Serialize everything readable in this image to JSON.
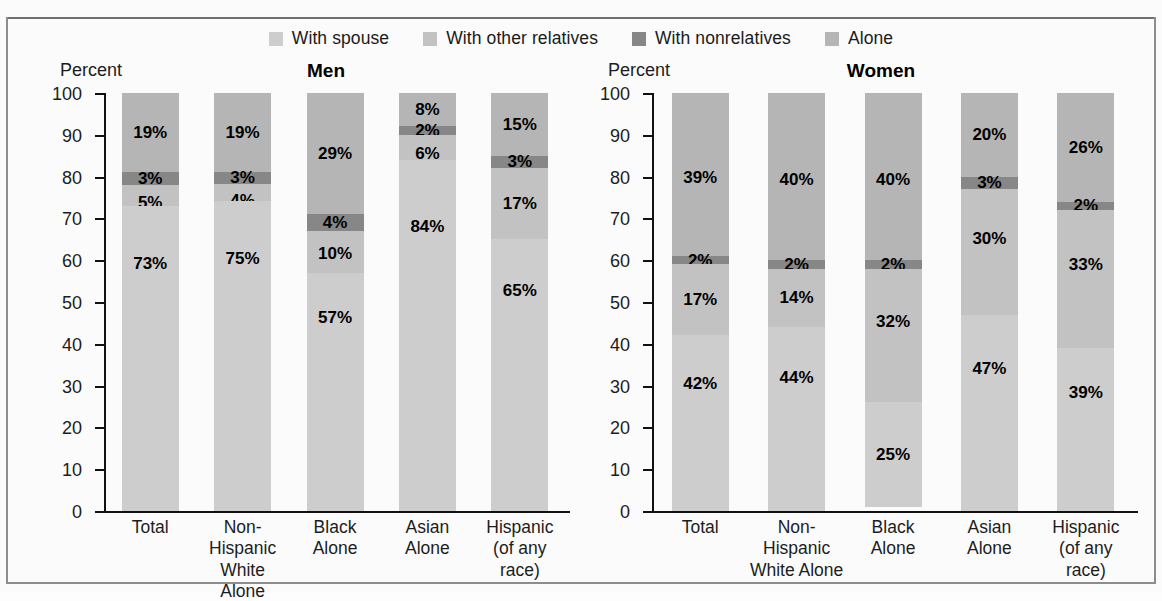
{
  "figure": {
    "percent_axis_label": "Percent"
  },
  "legend": {
    "items": [
      {
        "label": "With spouse",
        "color": "#cdcdcd",
        "key": "with-spouse"
      },
      {
        "label": "With other relatives",
        "color": "#c2c2c2",
        "key": "with-other-relatives"
      },
      {
        "label": "With nonrelatives",
        "color": "#878787",
        "key": "with-nonrelatives"
      },
      {
        "label": "Alone",
        "color": "#b5b5b5",
        "key": "alone"
      }
    ]
  },
  "chart_data": [
    {
      "type": "bar",
      "title": "Men",
      "xlabel": "",
      "ylabel": "Percent",
      "ylim": [
        0,
        100
      ],
      "yticks": [
        100,
        90,
        80,
        70,
        60,
        50,
        40,
        30,
        20,
        10,
        0
      ],
      "grid": false,
      "legend_position": "top-center",
      "stacked": true,
      "categories": [
        "Total",
        "Non-Hispanic White Alone",
        "Black Alone",
        "Asian Alone",
        "Hispanic (of any race)"
      ],
      "category_lines": [
        [
          "Total",
          ""
        ],
        [
          "Non-Hispanic",
          "White Alone"
        ],
        [
          "Black",
          "Alone"
        ],
        [
          "Asian",
          "Alone"
        ],
        [
          "Hispanic",
          "(of any race)"
        ]
      ],
      "series": [
        {
          "name": "With spouse",
          "values": [
            73,
            75,
            57,
            84,
            65
          ]
        },
        {
          "name": "With other relatives",
          "values": [
            5,
            4,
            10,
            6,
            17
          ]
        },
        {
          "name": "With nonrelatives",
          "values": [
            3,
            3,
            4,
            2,
            3
          ]
        },
        {
          "name": "Alone",
          "values": [
            19,
            19,
            29,
            8,
            15
          ]
        }
      ],
      "labels": {
        "With spouse": [
          "73%",
          "75%",
          "57%",
          "84%",
          "65%"
        ],
        "With other relatives": [
          "5%",
          "4%",
          "10%",
          "6%",
          "17%"
        ],
        "With nonrelatives": [
          "3%",
          "3%",
          "4%",
          "2%",
          "3%"
        ],
        "Alone": [
          "19%",
          "19%",
          "29%",
          "8%",
          "15%"
        ]
      }
    },
    {
      "type": "bar",
      "title": "Women",
      "xlabel": "",
      "ylabel": "Percent",
      "ylim": [
        0,
        100
      ],
      "yticks": [
        100,
        90,
        80,
        70,
        60,
        50,
        40,
        30,
        20,
        10,
        0
      ],
      "grid": false,
      "legend_position": "top-center",
      "stacked": true,
      "categories": [
        "Total",
        "Non-Hispanic White Alone",
        "Black Alone",
        "Asian Alone",
        "Hispanic (of any race)"
      ],
      "category_lines": [
        [
          "Total",
          ""
        ],
        [
          "Non-Hispanic",
          "White Alone"
        ],
        [
          "Black",
          "Alone"
        ],
        [
          "Asian",
          "Alone"
        ],
        [
          "Hispanic",
          "(of any race)"
        ]
      ],
      "series": [
        {
          "name": "With spouse",
          "values": [
            42,
            44,
            25,
            47,
            39
          ]
        },
        {
          "name": "With other relatives",
          "values": [
            17,
            14,
            32,
            30,
            33
          ]
        },
        {
          "name": "With nonrelatives",
          "values": [
            2,
            2,
            2,
            3,
            2
          ]
        },
        {
          "name": "Alone",
          "values": [
            39,
            40,
            40,
            20,
            26
          ]
        }
      ],
      "labels": {
        "With spouse": [
          "42%",
          "44%",
          "25%",
          "47%",
          "39%"
        ],
        "With other relatives": [
          "17%",
          "14%",
          "32%",
          "30%",
          "33%"
        ],
        "With nonrelatives": [
          "2%",
          "2%",
          "2%",
          "3%",
          "2%"
        ],
        "Alone": [
          "39%",
          "40%",
          "40%",
          "20%",
          "26%"
        ]
      }
    }
  ]
}
